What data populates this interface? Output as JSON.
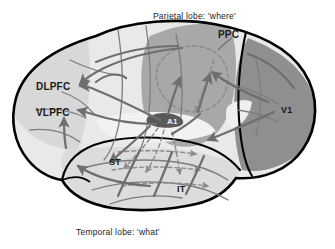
{
  "figure": {
    "background_color": "#ffffff",
    "outline_color": "#000000"
  },
  "captions": [
    {
      "id": "parietal-caption",
      "text": "Parietal lobe: 'where'",
      "x": 153,
      "y": 12
    },
    {
      "id": "temporal-caption",
      "text": "Temporal lobe: 'what'",
      "x": 76,
      "y": 228
    }
  ],
  "regions": [
    {
      "id": "ppc",
      "label": "PPC",
      "full_name": "posterior parietal cortex",
      "x": 218,
      "y": 30,
      "fill": "#a8a8a8"
    },
    {
      "id": "v1",
      "label": "V1",
      "full_name": "primary visual cortex",
      "x": 281,
      "y": 106,
      "fill": "#8f8f8f"
    },
    {
      "id": "dlpfc",
      "label": "DLPFC",
      "full_name": "dorsolateral prefrontal cortex",
      "x": 36,
      "y": 82,
      "fill": "#d2d2d2"
    },
    {
      "id": "vlpfc",
      "label": "VLPFC",
      "full_name": "ventrolateral prefrontal cortex",
      "x": 36,
      "y": 108,
      "fill": "#d2d2d2"
    },
    {
      "id": "a1",
      "label": "A1",
      "full_name": "primary auditory cortex",
      "x": 167,
      "y": 118,
      "fill": "#585858"
    },
    {
      "id": "st",
      "label": "ST",
      "full_name": "superior temporal",
      "x": 109,
      "y": 158,
      "fill": "#d6d6d6"
    },
    {
      "id": "it",
      "label": "IT",
      "full_name": "inferior temporal",
      "x": 177,
      "y": 185,
      "fill": "#d6d6d6"
    }
  ],
  "palette": {
    "brain_base": "#e9e9e9",
    "frontal_shade": "#d8d8d8",
    "temporal_shade": "#dcdcdc",
    "parietal_shade": "#a8a8a8",
    "occipital_shade": "#8f8f8f",
    "a1_patch": "#5a5a5a",
    "arrow_solid": "#6e6e6e",
    "arrow_dashed": "#8a8a8a",
    "sulcus_line": "#7d7d7d",
    "outline": "#000000"
  },
  "streams": [
    {
      "id": "dorsal-where-stream",
      "name": "dorsal 'where' stream",
      "style": "solid",
      "description": "A1 and V1 to PPC to DLPFC"
    },
    {
      "id": "ventral-what-stream",
      "name": "ventral 'what' stream",
      "style": "dashed",
      "description": "A1 through ST and IT to VLPFC"
    }
  ]
}
